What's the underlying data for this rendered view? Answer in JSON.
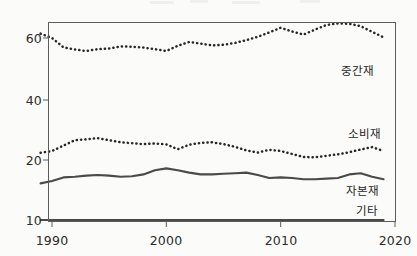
{
  "chart_data": {
    "type": "line",
    "title": "",
    "subtitle": "",
    "xlabel": "",
    "ylabel": "",
    "grid": false,
    "legend_position": "inline-right",
    "x": [
      1989,
      1990,
      1991,
      1992,
      1993,
      1994,
      1995,
      1996,
      1997,
      1998,
      1999,
      2000,
      2001,
      2002,
      2003,
      2004,
      2005,
      2006,
      2007,
      2008,
      2009,
      2010,
      2011,
      2012,
      2013,
      2014,
      2015,
      2016,
      2017,
      2018,
      2019
    ],
    "xlim": [
      1989,
      2019
    ],
    "xticks": [
      1990,
      2000,
      2010,
      2020
    ],
    "xtick_labels": [
      "1990",
      "2000",
      "2010",
      "2020"
    ],
    "ylim": [
      10,
      68
    ],
    "yticks": [
      10,
      20,
      40,
      60
    ],
    "ytick_labels": [
      "10",
      "20",
      "40",
      "60"
    ],
    "y_axis_note": "non-linear: 10-to-20 segment is visually stretched",
    "series": [
      {
        "name": "중간재",
        "style": "dotted",
        "color": "#262626",
        "values": [
          61.4,
          60.0,
          57.0,
          56.3,
          55.8,
          56.4,
          56.6,
          57.3,
          57.2,
          56.9,
          56.4,
          55.8,
          57.5,
          58.7,
          58.2,
          57.6,
          57.8,
          58.4,
          59.3,
          60.4,
          61.8,
          63.3,
          62.1,
          61.1,
          62.7,
          64.2,
          64.7,
          64.6,
          63.8,
          62.0,
          60.2
        ]
      },
      {
        "name": "소비재",
        "style": "dotted",
        "color": "#262626",
        "values": [
          22.4,
          23.0,
          24.8,
          26.6,
          26.9,
          27.3,
          26.6,
          25.9,
          25.6,
          25.3,
          25.5,
          25.2,
          23.6,
          25.1,
          25.7,
          25.9,
          25.3,
          24.4,
          23.2,
          22.5,
          23.4,
          23.0,
          22.0,
          21.0,
          20.9,
          21.4,
          21.9,
          22.6,
          23.5,
          24.3,
          23.0
        ]
      },
      {
        "name": "자본재",
        "style": "solid",
        "color": "#4a4a4a",
        "values": [
          16.1,
          16.5,
          17.1,
          17.2,
          17.4,
          17.5,
          17.4,
          17.2,
          17.3,
          17.6,
          18.3,
          18.6,
          18.3,
          17.9,
          17.6,
          17.6,
          17.7,
          17.8,
          17.9,
          17.5,
          17.0,
          17.1,
          17.0,
          16.8,
          16.8,
          16.9,
          17.0,
          17.6,
          17.8,
          17.2,
          16.8
        ]
      },
      {
        "name": "기타",
        "style": "solid",
        "color": "#4a4a4a",
        "values": [
          10.0,
          10.0,
          10.0,
          10.0,
          10.0,
          10.0,
          10.0,
          10.0,
          10.0,
          10.0,
          10.0,
          10.0,
          10.0,
          10.0,
          10.0,
          10.0,
          10.0,
          10.0,
          10.0,
          10.0,
          10.0,
          10.0,
          10.0,
          10.0,
          10.0,
          10.0,
          10.0,
          10.0,
          10.0,
          10.0,
          10.0
        ]
      }
    ]
  },
  "axis": {
    "y_labels": [
      "60",
      "40",
      "20",
      "10"
    ],
    "x_labels": [
      "1990",
      "2000",
      "2010",
      "2020"
    ]
  },
  "labels": {
    "jungganjae": "중간재",
    "sobijae": "소비재",
    "jabonjae": "자본재",
    "gita": "기타"
  },
  "colors": {
    "ink": "#262626",
    "line": "#4a4a4a",
    "frame": "#5d5d5d",
    "background": "#fbfbfa"
  }
}
